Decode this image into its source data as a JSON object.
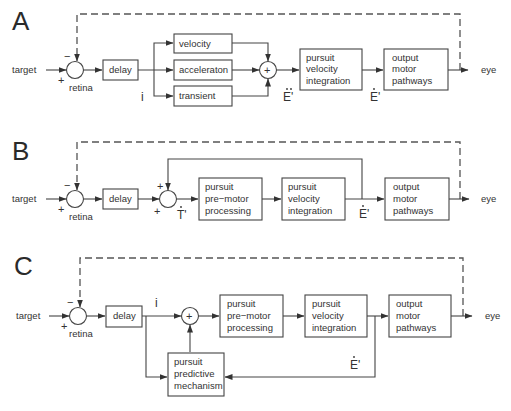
{
  "panels": {
    "A": {
      "letter": "A",
      "input": "target",
      "comparator": "retina",
      "sign_minus": "−",
      "sign_plus": "+",
      "delay": "delay",
      "branches": [
        "velocity",
        "acceleraton",
        "transient"
      ],
      "sum_symbol": "+",
      "signal_after_delay": "i",
      "signal_after_sum": "E'",
      "signal_after_integration": "E'",
      "integration": [
        "pursuit",
        "velocity",
        "integration"
      ],
      "output": [
        "output",
        "motor",
        "pathways"
      ],
      "eye": "eye"
    },
    "B": {
      "letter": "B",
      "input": "target",
      "comparator": "retina",
      "sign_minus": "−",
      "sign_plus": "+",
      "delay": "delay",
      "sum_sign_top": "+",
      "sum_sign_bottom": "+",
      "signal_after_sum": "T'",
      "premotor": [
        "pursuit",
        "pre−motor",
        "processing"
      ],
      "integration": [
        "pursuit",
        "velocity",
        "integration"
      ],
      "signal_after_integration": "E'",
      "output": [
        "output",
        "motor",
        "pathways"
      ],
      "eye": "eye"
    },
    "C": {
      "letter": "C",
      "input": "target",
      "comparator": "retina",
      "sign_minus": "−",
      "sign_plus": "+",
      "delay": "delay",
      "signal_after_delay": "i",
      "sum_symbol": "+",
      "premotor": [
        "pursuit",
        "pre−motor",
        "processing"
      ],
      "integration": [
        "pursuit",
        "velocity",
        "integration"
      ],
      "predictive": [
        "pursuit",
        "predictive",
        "mechanism"
      ],
      "signal_feedback": "E'",
      "output": [
        "output",
        "motor",
        "pathways"
      ],
      "eye": "eye"
    }
  }
}
